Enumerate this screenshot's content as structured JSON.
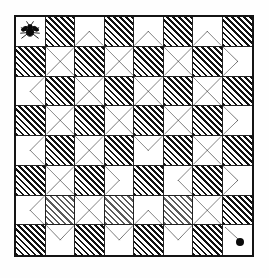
{
  "figure": {
    "title": "Chessboard fly path puzzle",
    "description": "8 by 8 checkered board with diagonal dashed path segments drawn across the light squares, a fly on the top-left square and a black dot on the bottom-right square.",
    "board_size": 8,
    "colors": {
      "ink": "#141414",
      "hatch": "#111111",
      "paper": "#ffffff",
      "dot": "#0a0a0a"
    },
    "markers": {
      "start": {
        "name": "fly",
        "row": 1,
        "col": 1,
        "label": "fly"
      },
      "end": {
        "name": "dot",
        "row": 8,
        "col": 8,
        "label": "dot"
      }
    },
    "legend": {
      "hatched_label": "hatched square",
      "light_label": "light square",
      "path_label": "dashed diagonal path"
    }
  },
  "chart_data": {
    "type": "heatmap",
    "title": "Chessboard fly path puzzle",
    "xlabel": "",
    "ylabel": "",
    "categories": [
      "1",
      "2",
      "3",
      "4",
      "5",
      "6",
      "7",
      "8"
    ],
    "rows": [
      {
        "row": 1,
        "cells": [
          {
            "col": 1,
            "shade": "light",
            "path": "none",
            "marker": "fly"
          },
          {
            "col": 2,
            "shade": "hatch",
            "path": "none",
            "marker": ""
          },
          {
            "col": 3,
            "shade": "light",
            "path": "up",
            "marker": ""
          },
          {
            "col": 4,
            "shade": "hatch",
            "path": "none",
            "marker": ""
          },
          {
            "col": 5,
            "shade": "light",
            "path": "up",
            "marker": ""
          },
          {
            "col": 6,
            "shade": "hatch",
            "path": "none",
            "marker": ""
          },
          {
            "col": 7,
            "shade": "light",
            "path": "up",
            "marker": ""
          },
          {
            "col": 8,
            "shade": "hatch",
            "path": "none",
            "marker": ""
          }
        ]
      },
      {
        "row": 2,
        "cells": [
          {
            "col": 1,
            "shade": "hatch",
            "path": "none",
            "marker": ""
          },
          {
            "col": 2,
            "shade": "light",
            "path": "cross",
            "marker": ""
          },
          {
            "col": 3,
            "shade": "hatch",
            "path": "none",
            "marker": ""
          },
          {
            "col": 4,
            "shade": "light",
            "path": "cross",
            "marker": ""
          },
          {
            "col": 5,
            "shade": "hatch",
            "path": "none",
            "marker": ""
          },
          {
            "col": 6,
            "shade": "light",
            "path": "cross",
            "marker": ""
          },
          {
            "col": 7,
            "shade": "hatch",
            "path": "none",
            "marker": ""
          },
          {
            "col": 8,
            "shade": "light",
            "path": "right",
            "marker": ""
          }
        ]
      },
      {
        "row": 3,
        "cells": [
          {
            "col": 1,
            "shade": "light",
            "path": "left",
            "marker": ""
          },
          {
            "col": 2,
            "shade": "hatch",
            "path": "none",
            "marker": ""
          },
          {
            "col": 3,
            "shade": "light",
            "path": "cross",
            "marker": ""
          },
          {
            "col": 4,
            "shade": "hatch",
            "path": "none",
            "marker": ""
          },
          {
            "col": 5,
            "shade": "light",
            "path": "cross",
            "marker": ""
          },
          {
            "col": 6,
            "shade": "hatch",
            "path": "none",
            "marker": ""
          },
          {
            "col": 7,
            "shade": "light",
            "path": "cross",
            "marker": ""
          },
          {
            "col": 8,
            "shade": "hatch",
            "path": "none",
            "marker": ""
          }
        ]
      },
      {
        "row": 4,
        "cells": [
          {
            "col": 1,
            "shade": "hatch",
            "path": "none",
            "marker": ""
          },
          {
            "col": 2,
            "shade": "light",
            "path": "cross",
            "marker": ""
          },
          {
            "col": 3,
            "shade": "hatch",
            "path": "none",
            "marker": ""
          },
          {
            "col": 4,
            "shade": "light",
            "path": "cross",
            "marker": ""
          },
          {
            "col": 5,
            "shade": "hatch",
            "path": "none",
            "marker": ""
          },
          {
            "col": 6,
            "shade": "light",
            "path": "cross",
            "marker": ""
          },
          {
            "col": 7,
            "shade": "hatch",
            "path": "none",
            "marker": ""
          },
          {
            "col": 8,
            "shade": "light",
            "path": "right",
            "marker": ""
          }
        ]
      },
      {
        "row": 5,
        "cells": [
          {
            "col": 1,
            "shade": "light",
            "path": "left",
            "marker": ""
          },
          {
            "col": 2,
            "shade": "hatch",
            "path": "none",
            "marker": ""
          },
          {
            "col": 3,
            "shade": "light",
            "path": "cross",
            "marker": ""
          },
          {
            "col": 4,
            "shade": "hatch",
            "path": "none",
            "marker": ""
          },
          {
            "col": 5,
            "shade": "light",
            "path": "down",
            "marker": ""
          },
          {
            "col": 6,
            "shade": "hatch",
            "path": "none",
            "marker": ""
          },
          {
            "col": 7,
            "shade": "light",
            "path": "cross",
            "marker": ""
          },
          {
            "col": 8,
            "shade": "hatch",
            "path": "none",
            "marker": ""
          }
        ]
      },
      {
        "row": 6,
        "cells": [
          {
            "col": 1,
            "shade": "hatch",
            "path": "none",
            "marker": ""
          },
          {
            "col": 2,
            "shade": "light",
            "path": "cross",
            "marker": ""
          },
          {
            "col": 3,
            "shade": "hatch",
            "path": "none",
            "marker": ""
          },
          {
            "col": 4,
            "shade": "light",
            "path": "right",
            "marker": ""
          },
          {
            "col": 5,
            "shade": "hatch",
            "path": "none",
            "marker": ""
          },
          {
            "col": 6,
            "shade": "light",
            "path": "left",
            "marker": ""
          },
          {
            "col": 7,
            "shade": "hatch",
            "path": "none",
            "marker": ""
          },
          {
            "col": 8,
            "shade": "light",
            "path": "right",
            "marker": ""
          }
        ]
      },
      {
        "row": 7,
        "cells": [
          {
            "col": 1,
            "shade": "light",
            "path": "left",
            "marker": ""
          },
          {
            "col": 2,
            "shade": "faded",
            "path": "none",
            "marker": ""
          },
          {
            "col": 3,
            "shade": "light",
            "path": "cross",
            "marker": ""
          },
          {
            "col": 4,
            "shade": "faded",
            "path": "none",
            "marker": ""
          },
          {
            "col": 5,
            "shade": "light",
            "path": "up",
            "marker": ""
          },
          {
            "col": 6,
            "shade": "faded",
            "path": "none",
            "marker": ""
          },
          {
            "col": 7,
            "shade": "light",
            "path": "cross",
            "marker": ""
          },
          {
            "col": 8,
            "shade": "hatch",
            "path": "none",
            "marker": ""
          }
        ]
      },
      {
        "row": 8,
        "cells": [
          {
            "col": 1,
            "shade": "hatch",
            "path": "none",
            "marker": ""
          },
          {
            "col": 2,
            "shade": "light",
            "path": "down",
            "marker": ""
          },
          {
            "col": 3,
            "shade": "hatch",
            "path": "none",
            "marker": ""
          },
          {
            "col": 4,
            "shade": "light",
            "path": "down",
            "marker": ""
          },
          {
            "col": 5,
            "shade": "hatch",
            "path": "none",
            "marker": ""
          },
          {
            "col": 6,
            "shade": "light",
            "path": "down",
            "marker": ""
          },
          {
            "col": 7,
            "shade": "hatch",
            "path": "none",
            "marker": ""
          },
          {
            "col": 8,
            "shade": "light",
            "path": "none",
            "marker": "dot"
          }
        ]
      }
    ]
  }
}
